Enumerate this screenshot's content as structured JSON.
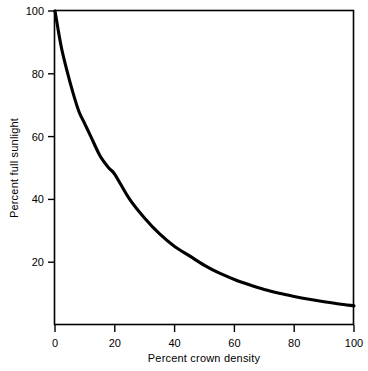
{
  "chart_data": {
    "type": "line",
    "title": "",
    "subtitle": "",
    "xlabel": "Percent crown density",
    "ylabel": "Percent full sunlight",
    "xlim": [
      0,
      100
    ],
    "ylim": [
      0,
      100
    ],
    "xticks": [
      "0",
      "20",
      "40",
      "60",
      "80",
      "100"
    ],
    "xtick_values": [
      0,
      20,
      40,
      60,
      80,
      100
    ],
    "yticks": [
      "20",
      "40",
      "60",
      "80",
      "100"
    ],
    "ytick_values": [
      20,
      40,
      60,
      80,
      100
    ],
    "grid": false,
    "legend": null,
    "legend_position": "none",
    "annotations": [],
    "series": [
      {
        "name": "Percent full sunlight vs percent crown density",
        "color": "#000000",
        "x": [
          0,
          2,
          4,
          6,
          8,
          10,
          12,
          15,
          18,
          20,
          25,
          30,
          35,
          40,
          45,
          50,
          55,
          60,
          65,
          70,
          75,
          80,
          85,
          90,
          95,
          100
        ],
        "y": [
          100,
          89,
          81,
          74,
          68,
          64,
          60,
          54,
          50,
          48,
          40,
          34,
          29,
          25,
          22,
          19,
          16.5,
          14.5,
          12.8,
          11.3,
          10.1,
          9.1,
          8.2,
          7.4,
          6.7,
          6.1
        ]
      }
    ]
  },
  "axes": {
    "x_title": "Percent crown density",
    "y_title": "Percent full sunlight"
  }
}
